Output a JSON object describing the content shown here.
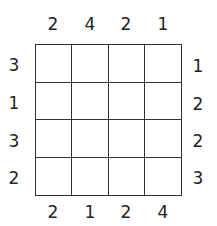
{
  "puzzle": {
    "size": 4,
    "clues": {
      "top": [
        "2",
        "4",
        "2",
        "1"
      ],
      "bottom": [
        "2",
        "1",
        "2",
        "4"
      ],
      "left": [
        "3",
        "1",
        "3",
        "2"
      ],
      "right": [
        "1",
        "2",
        "2",
        "3"
      ]
    },
    "cells": [
      [
        "",
        "",
        "",
        ""
      ],
      [
        "",
        "",
        "",
        ""
      ],
      [
        "",
        "",
        "",
        ""
      ],
      [
        "",
        "",
        "",
        ""
      ]
    ]
  }
}
